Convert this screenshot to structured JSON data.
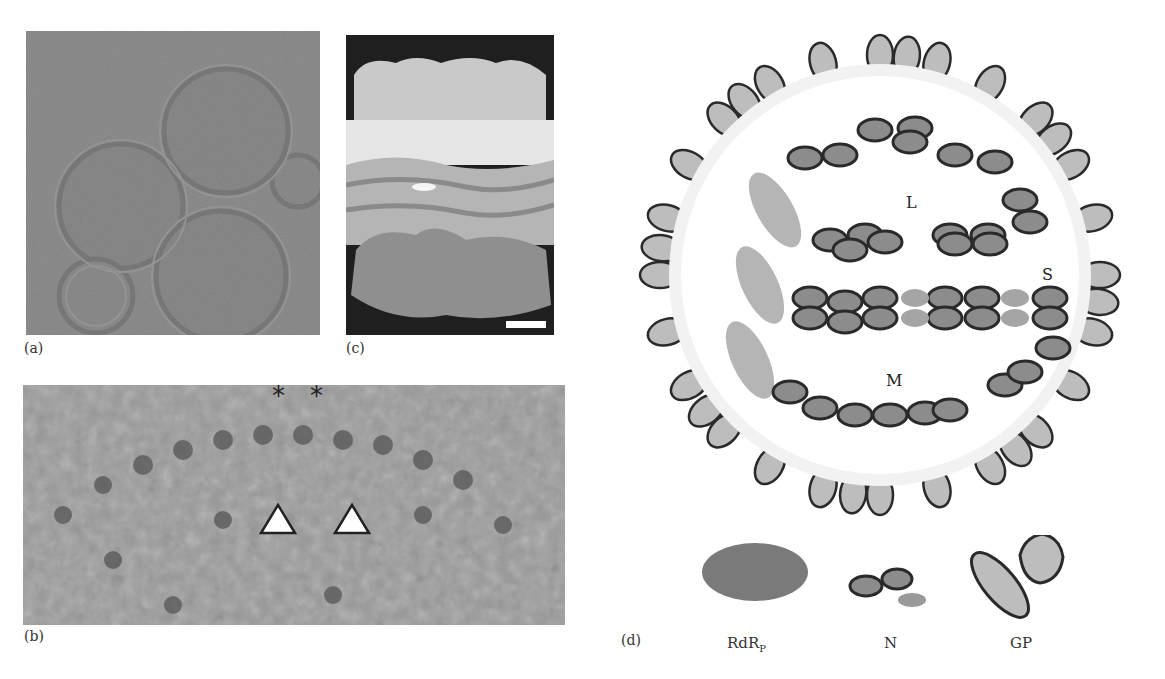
{
  "figure": {
    "panels": [
      {
        "id": "a",
        "label": "(a)",
        "type": "cryo-EM micrograph",
        "content": "virions"
      },
      {
        "id": "b",
        "label": "(b)",
        "type": "cryo-EM close-up",
        "markers": {
          "asterisks": [
            "*",
            "*"
          ],
          "arrowheads": 2
        }
      },
      {
        "id": "c",
        "label": "(c)",
        "type": "3D surface rendering",
        "scale_bar": true
      },
      {
        "id": "d",
        "label": "(d)",
        "type": "schematic diagram"
      }
    ],
    "diagram": {
      "segments": [
        "L",
        "S",
        "M"
      ],
      "legend": [
        {
          "key": "rdrp",
          "label_main": "RdR",
          "label_sub": "P"
        },
        {
          "key": "n",
          "label_main": "N",
          "label_sub": ""
        },
        {
          "key": "gp",
          "label_main": "GP",
          "label_sub": ""
        }
      ],
      "colors": {
        "rdrp": "#7a7a7a",
        "n_fill": "#8c8c8c",
        "n_outline": "#2a2a2a",
        "gp_fill": "#bdbdbd",
        "membrane": "#f2f2f2"
      }
    }
  }
}
